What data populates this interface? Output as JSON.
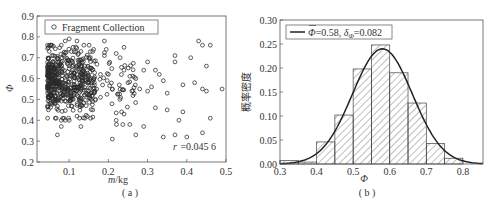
{
  "chart_data": [
    {
      "id": "a",
      "type": "scatter",
      "caption": "( a )",
      "xlabel": "m/kg",
      "ylabel": "Φ",
      "xlim": [
        0.018,
        0.5
      ],
      "ylim": [
        0.2,
        0.9
      ],
      "xticks": [
        "0.1",
        "0.2",
        "0.3",
        "0.4",
        "0.5"
      ],
      "yticks": [
        "0.2",
        "0.3",
        "0.4",
        "0.5",
        "0.6",
        "0.7",
        "0.8",
        "0.9"
      ],
      "legend": [
        "Fragment Collection"
      ],
      "legend_position": "upper left",
      "annotation": "r =0.045 6",
      "grid": false,
      "series": [
        {
          "name": "Fragment Collection",
          "marker": "open-circle",
          "description": "Dense cluster for m 0.04–0.15 kg with Φ 0.40–0.78; sparse scatter for m 0.15–0.5 kg with Φ 0.31–0.79",
          "points": [
            [
              0.07,
              0.33
            ],
            [
              0.08,
              0.37
            ],
            [
              0.08,
              0.4
            ],
            [
              0.09,
              0.4
            ],
            [
              0.1,
              0.4
            ],
            [
              0.13,
              0.37
            ],
            [
              0.12,
              0.42
            ],
            [
              0.14,
              0.41
            ],
            [
              0.21,
              0.31
            ],
            [
              0.22,
              0.4
            ],
            [
              0.24,
              0.43
            ],
            [
              0.27,
              0.33
            ],
            [
              0.29,
              0.37
            ],
            [
              0.32,
              0.46
            ],
            [
              0.34,
              0.32
            ],
            [
              0.35,
              0.45
            ],
            [
              0.37,
              0.33
            ],
            [
              0.38,
              0.4
            ],
            [
              0.39,
              0.44
            ],
            [
              0.4,
              0.32
            ],
            [
              0.44,
              0.34
            ],
            [
              0.46,
              0.41
            ],
            [
              0.49,
              0.55
            ],
            [
              0.45,
              0.54
            ],
            [
              0.44,
              0.55
            ],
            [
              0.42,
              0.58
            ],
            [
              0.41,
              0.7
            ],
            [
              0.43,
              0.78
            ],
            [
              0.44,
              0.76
            ],
            [
              0.46,
              0.76
            ],
            [
              0.45,
              0.66
            ],
            [
              0.39,
              0.57
            ],
            [
              0.37,
              0.68
            ],
            [
              0.37,
              0.71
            ],
            [
              0.35,
              0.53
            ],
            [
              0.34,
              0.59
            ],
            [
              0.33,
              0.62
            ],
            [
              0.32,
              0.64
            ],
            [
              0.31,
              0.56
            ],
            [
              0.3,
              0.68
            ],
            [
              0.3,
              0.54
            ],
            [
              0.29,
              0.64
            ],
            [
              0.28,
              0.55
            ],
            [
              0.27,
              0.6
            ],
            [
              0.26,
              0.54
            ],
            [
              0.25,
              0.58
            ],
            [
              0.24,
              0.75
            ],
            [
              0.24,
              0.64
            ],
            [
              0.23,
              0.7
            ],
            [
              0.22,
              0.72
            ],
            [
              0.21,
              0.55
            ],
            [
              0.2,
              0.62
            ],
            [
              0.19,
              0.78
            ],
            [
              0.19,
              0.71
            ],
            [
              0.18,
              0.62
            ],
            [
              0.18,
              0.51
            ],
            [
              0.17,
              0.55
            ],
            [
              0.16,
              0.45
            ],
            [
              0.16,
              0.73
            ],
            [
              0.15,
              0.58
            ],
            [
              0.14,
              0.66
            ],
            [
              0.13,
              0.73
            ],
            [
              0.12,
              0.78
            ],
            [
              0.11,
              0.75
            ],
            [
              0.1,
              0.79
            ],
            [
              0.09,
              0.78
            ],
            [
              0.08,
              0.76
            ]
          ]
        }
      ]
    },
    {
      "id": "b",
      "type": "bar",
      "subtype": "histogram-with-normal-fit",
      "caption": "( b )",
      "xlabel": "Φ",
      "ylabel": "概率密度",
      "xlim": [
        0.3,
        0.855
      ],
      "ylim": [
        0.0,
        0.3
      ],
      "xticks": [
        "0.3",
        "0.4",
        "0.5",
        "0.6",
        "0.7",
        "0.8"
      ],
      "yticks": [
        "0.00",
        "0.05",
        "0.10",
        "0.15",
        "0.20",
        "0.25",
        "0.30"
      ],
      "legend": [
        "Φ̄=0.58, δΦ=0.082"
      ],
      "legend_position": "upper left",
      "grid": false,
      "categories": [
        "0.30-0.35",
        "0.35-0.40",
        "0.40-0.45",
        "0.45-0.50",
        "0.50-0.55",
        "0.55-0.60",
        "0.60-0.65",
        "0.65-0.70",
        "0.70-0.75",
        "0.75-0.80"
      ],
      "bin_edges": [
        0.3,
        0.35,
        0.4,
        0.45,
        0.5,
        0.55,
        0.6,
        0.65,
        0.7,
        0.75,
        0.8
      ],
      "values": [
        0.007,
        0.004,
        0.046,
        0.102,
        0.198,
        0.248,
        0.19,
        0.127,
        0.043,
        0.012
      ],
      "series": [
        {
          "name": "histogram",
          "style": "hatched bars",
          "values": [
            0.007,
            0.004,
            0.046,
            0.102,
            0.198,
            0.248,
            0.19,
            0.127,
            0.043,
            0.012
          ]
        },
        {
          "name": "Φ̄=0.58, δΦ=0.082",
          "style": "normal curve",
          "mean": 0.58,
          "std": 0.082,
          "peak": 0.24
        }
      ]
    }
  ],
  "charts": {
    "a": {
      "legend_label": "Fragment Collection",
      "annotation": "r =0.045 6",
      "xlabel_italic": "m",
      "xlabel_rest": "/kg",
      "ylabel": "Φ",
      "caption": "( a )",
      "xticks": [
        "0.1",
        "0.2",
        "0.3",
        "0.4",
        "0.5"
      ],
      "yticks": [
        "0.2",
        "0.3",
        "0.4",
        "0.5",
        "0.6",
        "0.7",
        "0.8",
        "0.9"
      ]
    },
    "b": {
      "legend_bar": "Φ",
      "legend_rest1": "=0.58, ",
      "legend_delta": "δ",
      "legend_sub": "Φ",
      "legend_rest2": "=0.082",
      "xlabel": "Φ",
      "ylabel": "概率密度",
      "caption": "( b )",
      "xticks": [
        "0.3",
        "0.4",
        "0.5",
        "0.6",
        "0.7",
        "0.8"
      ],
      "yticks": [
        "0.00",
        "0.05",
        "0.10",
        "0.15",
        "0.20",
        "0.25",
        "0.30"
      ]
    }
  }
}
